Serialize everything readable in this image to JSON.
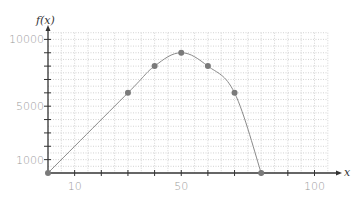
{
  "chart_data": {
    "type": "line",
    "title": "",
    "xlabel": "x",
    "ylabel": "f(x)",
    "x": [
      0,
      30,
      40,
      50,
      60,
      70,
      80
    ],
    "series": [
      {
        "name": "f(x)",
        "values": [
          0,
          6000,
          8000,
          9000,
          8000,
          6000,
          0
        ]
      }
    ],
    "x_tick_labels": [
      "10",
      "50",
      "100"
    ],
    "x_tick_label_values": [
      10,
      50,
      100
    ],
    "y_tick_labels": [
      "10000",
      "5000",
      "1000"
    ],
    "y_tick_label_values": [
      10000,
      5000,
      1000
    ],
    "xlim": [
      0,
      105
    ],
    "ylim": [
      0,
      10500
    ],
    "x_tick_step": 10,
    "y_tick_step": 1000,
    "grid": true,
    "grid_style": "dotted",
    "legend": "none",
    "colors": {
      "line": "#8a8a8a",
      "marker": "#7a7a7a",
      "axis": "#333333",
      "grid": "#c8c8c8",
      "tick_label": "#9a9a9a"
    }
  }
}
